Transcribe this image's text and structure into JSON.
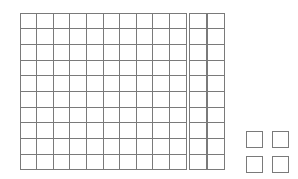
{
  "diagram": {
    "type": "base-ten-blocks",
    "background_color": "#ffffff",
    "line_color": "#7a7a7a",
    "fill_color": "#ffffff",
    "total_value": 124,
    "groups": [
      {
        "name": "hundreds-flat",
        "place_value": "hundreds",
        "label": "Hundreds flat",
        "blocks": 1,
        "rows": 10,
        "columns": 10,
        "units_per_block": 100,
        "value": 100
      },
      {
        "name": "tens-rods",
        "place_value": "tens",
        "label": "Tens rods",
        "blocks": 2,
        "rows": 10,
        "columns": 1,
        "units_per_block": 10,
        "value": 20
      },
      {
        "name": "ones-units",
        "place_value": "ones",
        "label": "Ones units",
        "blocks": 4,
        "rows": 2,
        "columns": 2,
        "units_per_block": 1,
        "value": 4
      }
    ]
  }
}
